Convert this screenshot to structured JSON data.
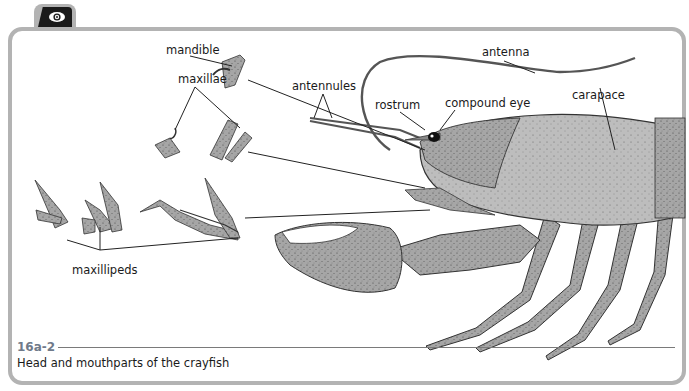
{
  "figure": {
    "number": "16a-2",
    "caption": "Head and mouthparts of the crayfish",
    "icon": "eye-icon"
  },
  "labels": {
    "mandible": "mandible",
    "maxillae": "maxillae",
    "maxillipeds": "maxillipeds",
    "antennules": "antennules",
    "rostrum": "rostrum",
    "compound_eye": "compound eye",
    "antenna": "antenna",
    "carapace": "carapace"
  },
  "colors": {
    "frame": "#b3b3b3",
    "figure_number": "#6f7a8a",
    "body_shade": "#9a9a9a"
  }
}
